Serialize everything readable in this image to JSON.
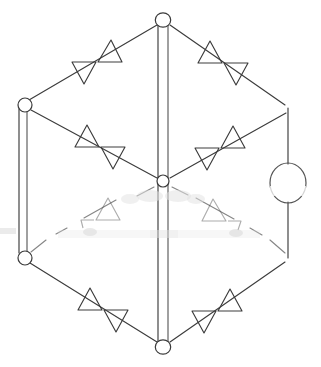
{
  "figure": {
    "title": "Hexagonal directed graph diagram",
    "background_color": "#ffffff",
    "ink_color": "#3c3c3c",
    "loop_color": "#555555",
    "width": 321,
    "height": 367
  },
  "chart_data": {
    "type": "diagram",
    "subtype": "directed-graph",
    "title": "Hexagonal directed graph diagram",
    "grid": false,
    "legend": "none",
    "node_count": 7,
    "edge_count": 9,
    "arrowhead_pair_count": 6,
    "self_loop_count": 1,
    "nodes": [
      {
        "id": "top",
        "label": "",
        "x": 163,
        "y": 20,
        "radius": 7.2,
        "shape": "circle",
        "drawn": true
      },
      {
        "id": "left-upper",
        "label": "",
        "x": 25,
        "y": 105,
        "radius": 7.0,
        "shape": "circle",
        "drawn": true
      },
      {
        "id": "right-upper",
        "label": "",
        "x": 288,
        "y": 108,
        "radius": 0,
        "shape": "corner",
        "drawn": false
      },
      {
        "id": "center",
        "label": "",
        "x": 163,
        "y": 181,
        "radius": 6.0,
        "shape": "circle",
        "drawn": true
      },
      {
        "id": "left-lower",
        "label": "",
        "x": 25,
        "y": 258,
        "radius": 7.0,
        "shape": "circle",
        "drawn": true
      },
      {
        "id": "right-lower",
        "label": "",
        "x": 288,
        "y": 258,
        "radius": 0,
        "shape": "corner",
        "drawn": false
      },
      {
        "id": "bottom",
        "label": "",
        "x": 163,
        "y": 347,
        "radius": 7.2,
        "shape": "circle",
        "drawn": true
      }
    ],
    "edges": [
      {
        "id": "e-top-leftupper",
        "from": "top",
        "to": "left-upper",
        "style": "single",
        "arrows": 2,
        "faded": false
      },
      {
        "id": "e-top-rightupper",
        "from": "top",
        "to": "right-upper",
        "style": "single",
        "arrows": 2,
        "faded": false
      },
      {
        "id": "e-leftupper-center",
        "from": "left-upper",
        "to": "center",
        "style": "single",
        "arrows": 2,
        "faded": false
      },
      {
        "id": "e-rightupper-center",
        "from": "right-upper",
        "to": "center",
        "style": "single",
        "arrows": 2,
        "faded": false
      },
      {
        "id": "e-center-leftlower",
        "from": "center",
        "to": "left-lower",
        "style": "single",
        "arrows": 2,
        "faded": true
      },
      {
        "id": "e-center-rightlower",
        "from": "center",
        "to": "right-lower",
        "style": "single",
        "arrows": 2,
        "faded": true
      },
      {
        "id": "e-leftlower-bottom",
        "from": "left-lower",
        "to": "bottom",
        "style": "single",
        "arrows": 2,
        "faded": false
      },
      {
        "id": "e-rightlower-bottom",
        "from": "right-lower",
        "to": "bottom",
        "style": "single",
        "arrows": 2,
        "faded": false
      },
      {
        "id": "e-left-vertical",
        "from": "left-upper",
        "to": "left-lower",
        "style": "double",
        "arrows": 0,
        "faded": false
      },
      {
        "id": "e-center-vertical",
        "from": "top",
        "to": "bottom",
        "style": "double",
        "arrows": 0,
        "faded": false
      },
      {
        "id": "e-right-vertical",
        "from": "right-upper",
        "to": "right-lower",
        "style": "single",
        "arrows": 0,
        "faded": false,
        "has_self_loop": true
      }
    ],
    "self_loop": {
      "id": "loop-right",
      "on_edge": "e-right-vertical",
      "center_x": 288,
      "center_y": 183,
      "radius_x": 18,
      "radius_y": 20
    },
    "arrow_pairs": [
      {
        "id": "arrows-top-left",
        "on_edge": "e-top-leftupper",
        "x": 97,
        "y": 58,
        "faded": false
      },
      {
        "id": "arrows-top-right",
        "on_edge": "e-top-rightupper",
        "x": 223,
        "y": 58,
        "faded": false
      },
      {
        "id": "arrows-mid-left",
        "on_edge": "e-leftupper-center",
        "x": 97,
        "y": 143,
        "faded": false
      },
      {
        "id": "arrows-mid-right",
        "on_edge": "e-rightupper-center",
        "x": 222,
        "y": 145,
        "faded": false
      },
      {
        "id": "arrows-low-left",
        "on_edge": "e-center-leftlower",
        "x": 97,
        "y": 216,
        "faded": true
      },
      {
        "id": "arrows-low-right",
        "on_edge": "e-center-rightlower",
        "x": 222,
        "y": 216,
        "faded": true
      },
      {
        "id": "arrows-bottom-left",
        "on_edge": "e-leftlower-bottom",
        "x": 97,
        "y": 305,
        "faded": false
      },
      {
        "id": "arrows-bottom-right",
        "on_edge": "e-rightlower-bottom",
        "x": 222,
        "y": 305,
        "faded": false
      }
    ],
    "annotations": [],
    "xlabel": "",
    "ylabel": "",
    "xlim": [
      0,
      321
    ],
    "ylim": [
      0,
      367
    ]
  }
}
